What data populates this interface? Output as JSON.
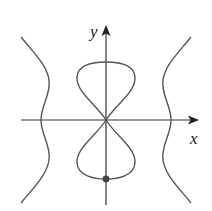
{
  "figure": {
    "type": "curve-plot",
    "axes": {
      "x_label": "x",
      "y_label": "y",
      "origin_px": [
        106,
        120
      ],
      "x_axis_px": [
        21,
        199
      ],
      "y_axis_px": [
        205,
        25
      ]
    },
    "curves": [
      {
        "name": "figure-eight-loop",
        "description": "lemniscate-like loop crossing at origin, upper and lower lobes"
      },
      {
        "name": "left-branch",
        "description": "wavy branch crossing negative x-axis"
      },
      {
        "name": "right-branch",
        "description": "wavy branch crossing positive x-axis"
      }
    ],
    "marked_point": {
      "name": "bottom-point",
      "px": [
        106,
        179
      ],
      "description": "dot at lowest point of lower lobe on y-axis"
    },
    "colors": {
      "curve": "#555555",
      "axis": "#333333",
      "point": "#444444",
      "background": "#ffffff"
    }
  }
}
